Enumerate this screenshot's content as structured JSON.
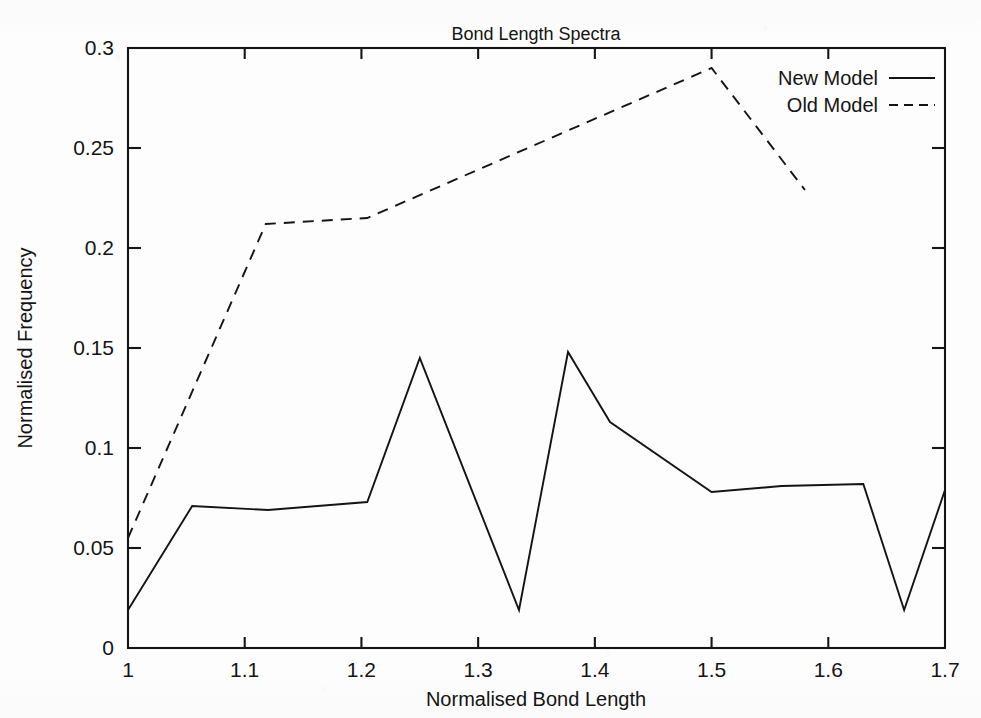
{
  "chart_data": {
    "type": "line",
    "title": "Bond Length Spectra",
    "xlabel": "Normalised Bond Length",
    "ylabel": "Normalised Frequency",
    "xlim": [
      1.0,
      1.7
    ],
    "ylim": [
      0.0,
      0.3
    ],
    "xticks": [
      "1",
      "1.1",
      "1.2",
      "1.3",
      "1.4",
      "1.5",
      "1.6",
      "1.7"
    ],
    "xtick_values": [
      1.0,
      1.1,
      1.2,
      1.3,
      1.4,
      1.5,
      1.6,
      1.7
    ],
    "yticks": [
      "0",
      "0.05",
      "0.1",
      "0.15",
      "0.2",
      "0.25",
      "0.3"
    ],
    "ytick_values": [
      0,
      0.05,
      0.1,
      0.15,
      0.2,
      0.25,
      0.3
    ],
    "grid": false,
    "legend_position": "top-right",
    "series": [
      {
        "name": "New Model",
        "style": "solid",
        "color": "#141414",
        "points": [
          [
            1.0,
            0.019
          ],
          [
            1.055,
            0.071
          ],
          [
            1.12,
            0.069
          ],
          [
            1.205,
            0.073
          ],
          [
            1.25,
            0.145
          ],
          [
            1.335,
            0.019
          ],
          [
            1.377,
            0.148
          ],
          [
            1.413,
            0.113
          ],
          [
            1.5,
            0.078
          ],
          [
            1.56,
            0.081
          ],
          [
            1.63,
            0.082
          ],
          [
            1.665,
            0.019
          ],
          [
            1.7,
            0.079
          ]
        ]
      },
      {
        "name": "Old Model",
        "style": "dashed",
        "color": "#141414",
        "points": [
          [
            1.0,
            0.055
          ],
          [
            1.118,
            0.212
          ],
          [
            1.205,
            0.215
          ],
          [
            1.5,
            0.29
          ],
          [
            1.58,
            0.229
          ]
        ]
      }
    ]
  },
  "legend": {
    "entries": [
      {
        "label": "New Model",
        "style": "solid"
      },
      {
        "label": "Old Model",
        "style": "dashed"
      }
    ]
  },
  "colors": {
    "ink": "#141414",
    "paper": "#fdfdfd"
  }
}
